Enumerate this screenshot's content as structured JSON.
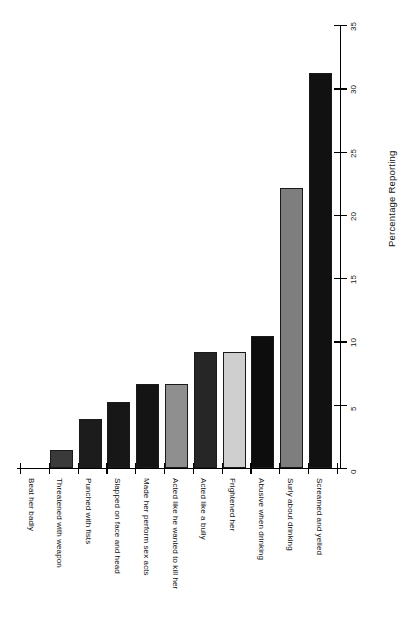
{
  "chart_data": {
    "type": "bar",
    "title": "",
    "subtitle": "",
    "xlabel": "",
    "ylabel": "Percentage  Reporting",
    "orientation": "vertical",
    "grid": false,
    "legend": "none",
    "ylim": [
      0,
      35
    ],
    "yticks": [
      0,
      5,
      10,
      15,
      20,
      25,
      30,
      35
    ],
    "ytick_labels": [
      "0",
      "5",
      "10",
      "15",
      "20",
      "25",
      "30",
      "35"
    ],
    "categories": [
      "Beat her badly",
      "Threatened with weapon",
      "Punched with fists",
      "Slapped on face and head",
      "Made her perform sex acts",
      "Acted like he wanted to kill her",
      "Acted like a bully",
      "Frightened her",
      "Abusive when drinking",
      "Surly about drinking",
      "Screamed and yelled"
    ],
    "values": [
      0,
      1.4,
      3.9,
      5.2,
      6.6,
      6.6,
      9.2,
      9.2,
      10.4,
      22.1,
      31.2
    ],
    "bar_colors": [
      "#1a1a1a",
      "#3a3a3a",
      "#1c1c1c",
      "#171717",
      "#141414",
      "#8f8f8f",
      "#262626",
      "#cfcfcf",
      "#0d0d0d",
      "#7e7e7e",
      "#111111"
    ],
    "bar_edge_color": "#1a1a1a",
    "axis_color": "#000000",
    "background_color": "#ffffff"
  }
}
